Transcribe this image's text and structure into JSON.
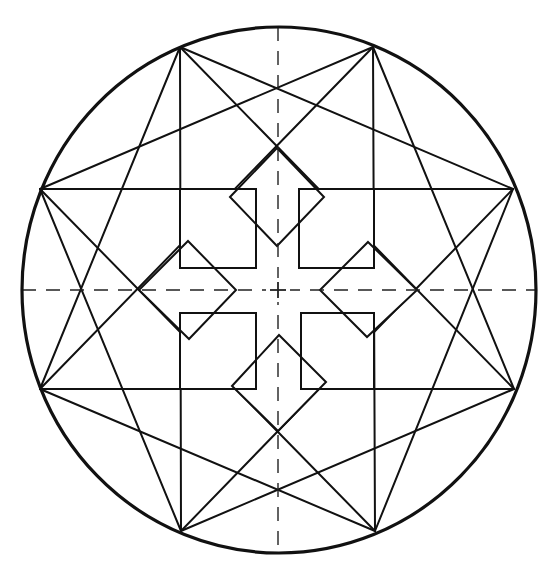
{
  "figure": {
    "width": 553,
    "height": 571,
    "colors": {
      "line": "#111111",
      "background": "#ffffff",
      "axis": "#222222"
    },
    "circle": {
      "cx": 279,
      "cy": 290,
      "rx": 257,
      "ry": 263,
      "stroke_width": 3.2
    },
    "vertices": {
      "A": [
        180,
        47
      ],
      "B": [
        373,
        47
      ],
      "C": [
        513,
        189
      ],
      "D": [
        514,
        389
      ],
      "E": [
        375,
        531
      ],
      "F": [
        181,
        531
      ],
      "G": [
        40,
        389
      ],
      "H": [
        40,
        189
      ]
    },
    "star_lines": [
      [
        "A",
        "C"
      ],
      [
        "B",
        "D"
      ],
      [
        "C",
        "E"
      ],
      [
        "D",
        "F"
      ],
      [
        "E",
        "G"
      ],
      [
        "F",
        "H"
      ],
      [
        "G",
        "A"
      ],
      [
        "H",
        "B"
      ],
      [
        "A",
        "D"
      ],
      [
        "B",
        "E"
      ],
      [
        "C",
        "F"
      ],
      [
        "D",
        "G"
      ],
      [
        "E",
        "H"
      ],
      [
        "F",
        "A"
      ],
      [
        "G",
        "B"
      ],
      [
        "H",
        "C"
      ]
    ],
    "line_width": 2,
    "squares": [
      {
        "name": "square-top-left",
        "x": 180,
        "y": 189,
        "w": 76,
        "h": 79
      },
      {
        "name": "square-top-right",
        "x": 299,
        "y": 189,
        "w": 75,
        "h": 79
      },
      {
        "name": "square-bottom-left",
        "x": 180,
        "y": 313,
        "w": 76,
        "h": 76
      },
      {
        "name": "square-bottom-right",
        "x": 301,
        "y": 313,
        "w": 73,
        "h": 76
      }
    ],
    "diamonds": [
      {
        "name": "diamond-top",
        "points": [
          [
            230,
            197
          ],
          [
            277,
            148
          ],
          [
            324,
            197
          ],
          [
            277,
            246
          ]
        ]
      },
      {
        "name": "diamond-right",
        "points": [
          [
            368,
            242
          ],
          [
            417,
            290
          ],
          [
            367,
            337
          ],
          [
            320,
            290
          ]
        ]
      },
      {
        "name": "diamond-bottom",
        "points": [
          [
            232,
            386
          ],
          [
            279,
            335
          ],
          [
            326,
            382
          ],
          [
            278,
            431
          ]
        ]
      },
      {
        "name": "diamond-left",
        "points": [
          [
            188,
            241
          ],
          [
            236,
            290
          ],
          [
            189,
            339
          ],
          [
            139,
            290
          ]
        ]
      }
    ],
    "cross_fill": [
      {
        "x": 256,
        "y": 189,
        "w": 45,
        "h": 200
      },
      {
        "x": 180,
        "y": 268,
        "w": 194,
        "h": 45
      }
    ],
    "axes": {
      "vertical": {
        "x": 278,
        "y1": 27,
        "y2": 553
      },
      "horizontal": {
        "y": 290,
        "x1": 22,
        "x2": 537
      },
      "dash": "14 10",
      "stroke_width": 1.4,
      "center_mark_size": 8
    }
  }
}
